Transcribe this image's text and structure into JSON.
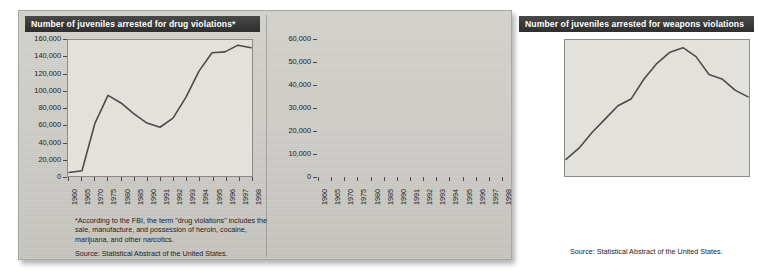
{
  "figure": {
    "background_color": "#cfcdc8",
    "title_bar_color": "#3a3a3a",
    "plot_background_color": "#e3e1dc",
    "line_color": "#4d4b48"
  },
  "left": {
    "title": "Number of juveniles arrested for drug violations*",
    "footnote": "*According to the FBI, the term \"drug violations\" includes the sale, manufacture, and possession of heroin, cocaine, marijuana, and other narcotics.",
    "source": "Source: Statistical Abstract of the United States."
  },
  "right": {
    "title": "Number of juveniles arrested for weapons violations",
    "source": "Source: Statistical Abstract of the United States."
  },
  "chart_data": [
    {
      "type": "line",
      "title": "Number of juveniles arrested for drug violations*",
      "xlabel": "",
      "ylabel": "",
      "xlim": [
        1960,
        1998
      ],
      "ylim": [
        0,
        160000
      ],
      "grid": false,
      "legend": "none",
      "ytick_labels": [
        "0",
        "20,000",
        "40,000",
        "60,000",
        "80,000",
        "100,000",
        "120,000",
        "140,000",
        "160,000"
      ],
      "ytick_values": [
        0,
        20000,
        40000,
        60000,
        80000,
        100000,
        120000,
        140000,
        160000
      ],
      "xtick_labels": [
        "1960",
        "1965",
        "1970",
        "1975",
        "1980",
        "1985",
        "1990",
        "1991",
        "1992",
        "1993",
        "1994",
        "1995",
        "1996",
        "1997",
        "1998"
      ],
      "x": [
        1960,
        1965,
        1970,
        1975,
        1980,
        1985,
        1990,
        1991,
        1992,
        1993,
        1994,
        1995,
        1996,
        1997,
        1998
      ],
      "values": [
        3000,
        5000,
        62000,
        95000,
        86000,
        73000,
        62000,
        57000,
        68000,
        93000,
        124000,
        146000,
        147000,
        155000,
        152000
      ]
    },
    {
      "type": "line",
      "title": "Number of juveniles arrested for weapons violations",
      "xlabel": "",
      "ylabel": "",
      "xlim": [
        1960,
        1998
      ],
      "ylim": [
        0,
        60000
      ],
      "grid": false,
      "legend": "none",
      "ytick_labels": [
        "0",
        "10,000",
        "20,000",
        "30,000",
        "40,000",
        "50,000",
        "60,000"
      ],
      "ytick_values": [
        0,
        10000,
        20000,
        30000,
        40000,
        50000,
        60000
      ],
      "xtick_labels": [
        "1960",
        "1965",
        "1970",
        "1975",
        "1980",
        "1985",
        "1990",
        "1991",
        "1992",
        "1993",
        "1994",
        "1995",
        "1996",
        "1997",
        "1998"
      ],
      "x": [
        1960,
        1965,
        1970,
        1975,
        1980,
        1985,
        1990,
        1991,
        1992,
        1993,
        1994,
        1995,
        1996,
        1997,
        1998
      ],
      "values": [
        7000,
        12000,
        19000,
        25000,
        31000,
        34000,
        43000,
        50000,
        55000,
        57000,
        53000,
        45000,
        43000,
        38000,
        35000
      ]
    }
  ]
}
